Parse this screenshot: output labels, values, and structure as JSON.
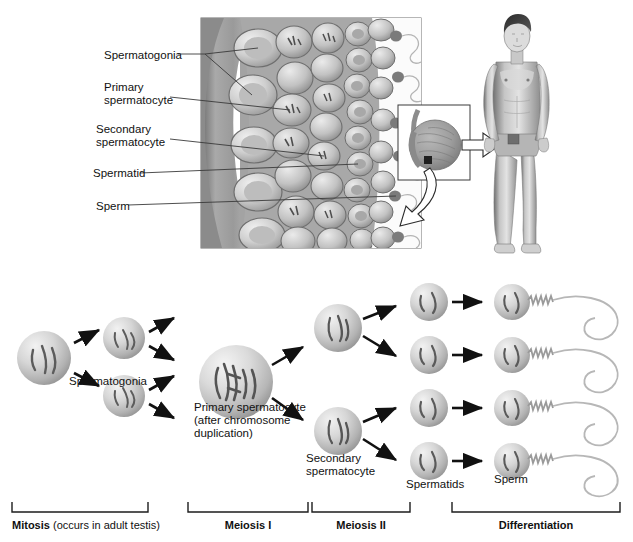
{
  "figure": {
    "top_panel": {
      "name": "seminiferous-tubule-cross-section",
      "labels": [
        {
          "id": "spermatogonia",
          "text": "Spermatogonia",
          "lines": 1
        },
        {
          "id": "primary-spermatocyte",
          "text": "Primary",
          "text2": "spermatocyte",
          "lines": 2
        },
        {
          "id": "secondary-spermatocyte",
          "text": "Secondary",
          "text2": "spermatocyte",
          "lines": 2
        },
        {
          "id": "spermatid",
          "text": "Spermatid",
          "lines": 1
        },
        {
          "id": "sperm",
          "text": "Sperm",
          "lines": 1
        }
      ],
      "inset": {
        "name": "testis-inset",
        "callout_arrow": "hollow-arrow-to-groin",
        "zoom_arrow": "hollow-curved-arrow-to-tubule"
      },
      "human_figure": {
        "name": "male-body-figure",
        "description": "standing adult male, anterior view"
      }
    },
    "flow": {
      "cells": [
        {
          "id": "stem-spermatogonium",
          "label": "",
          "type": "spermatogonium",
          "size": 52,
          "cx": 44,
          "cy": 390
        },
        {
          "id": "spermatogonium-1",
          "label": "Spermatogonia",
          "type": "spermatogonium",
          "size": 40,
          "cx": 122,
          "cy": 356
        },
        {
          "id": "spermatogonium-2",
          "label": "",
          "type": "spermatogonium",
          "size": 40,
          "cx": 122,
          "cy": 428
        },
        {
          "id": "primary-spermatocyte",
          "label": "Primary spermatocyte",
          "label_line2": "(after chromosome",
          "label_line3": "duplication)",
          "type": "primary-spermatocyte",
          "size": 70,
          "cx": 232,
          "cy": 382
        },
        {
          "id": "secondary-spermatocyte-1",
          "label": "",
          "type": "secondary-spermatocyte",
          "size": 46,
          "cx": 336,
          "cy": 329
        },
        {
          "id": "secondary-spermatocyte-2",
          "label": "Secondary spermatocyte",
          "type": "secondary-spermatocyte",
          "size": 46,
          "cx": 336,
          "cy": 432
        },
        {
          "id": "spermatid-1",
          "label": "",
          "type": "spermatid",
          "size": 38,
          "cx": 428,
          "cy": 302
        },
        {
          "id": "spermatid-2",
          "label": "",
          "type": "spermatid",
          "size": 38,
          "cx": 428,
          "cy": 355
        },
        {
          "id": "spermatid-3",
          "label": "",
          "type": "spermatid",
          "size": 38,
          "cx": 428,
          "cy": 408
        },
        {
          "id": "spermatid-4",
          "label": "Spermatids",
          "type": "spermatid",
          "size": 38,
          "cx": 428,
          "cy": 461
        },
        {
          "id": "sperm-1",
          "label": "",
          "type": "sperm",
          "size": 36,
          "cx": 512,
          "cy": 302
        },
        {
          "id": "sperm-2",
          "label": "",
          "type": "sperm",
          "size": 36,
          "cx": 512,
          "cy": 355
        },
        {
          "id": "sperm-3",
          "label": "",
          "type": "sperm",
          "size": 36,
          "cx": 512,
          "cy": 408
        },
        {
          "id": "sperm-4",
          "label": "Sperm",
          "type": "sperm",
          "size": 36,
          "cx": 512,
          "cy": 461
        }
      ],
      "inline_labels": {
        "spermatogonia": "Spermatogonia",
        "primary_spermatocyte_l1": "Primary spermatocyte",
        "primary_spermatocyte_l2": "(after chromosome",
        "primary_spermatocyte_l3": "duplication)",
        "secondary_spermatocyte_l1": "Secondary",
        "secondary_spermatocyte_l2": "spermatocyte",
        "spermatids": "Spermatids",
        "sperm": "Sperm"
      }
    },
    "stages": [
      {
        "id": "mitosis",
        "bold": "Mitosis",
        "rest": " (occurs in adult testis)",
        "x0": 12,
        "x1": 148
      },
      {
        "id": "meiosis-1",
        "bold": "Meiosis I",
        "rest": "",
        "x0": 188,
        "x1": 308
      },
      {
        "id": "meiosis-2",
        "bold": "Meiosis II",
        "rest": "",
        "x0": 312,
        "x1": 410
      },
      {
        "id": "differentiation",
        "bold": "Differentiation",
        "rest": "",
        "x0": 452,
        "x1": 620
      }
    ],
    "colors": {
      "cell_light": "#e4e4e4",
      "cell_mid": "#b8b8b8",
      "cell_dark": "#8d8d8d",
      "chromosome": "#5a5a5a",
      "tissue_mid": "#9a9a9a",
      "tissue_dark": "#707070",
      "outline": "#6f6f6f",
      "arrow": "#111111",
      "text": "#111111",
      "background": "#ffffff"
    }
  }
}
